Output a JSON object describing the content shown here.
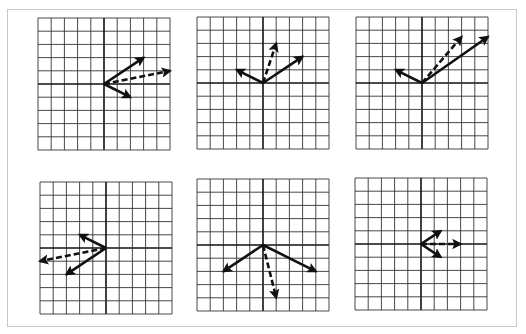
{
  "figure": {
    "grid_cells": 10,
    "colors": {
      "grid": "#333333",
      "axis": "#111111",
      "vector": "#111111",
      "frame": "#c8c8c8"
    }
  },
  "panels": [
    {
      "id": 1,
      "left": 38,
      "top": 18,
      "size": 132,
      "vectors": [
        {
          "style": "solid",
          "x": 3,
          "y": 2
        },
        {
          "style": "solid",
          "x": 2,
          "y": -1
        },
        {
          "style": "dashed",
          "x": 5,
          "y": 1
        }
      ]
    },
    {
      "id": 2,
      "left": 197,
      "top": 17,
      "size": 132,
      "vectors": [
        {
          "style": "solid",
          "x": 3,
          "y": 2
        },
        {
          "style": "solid",
          "x": -2,
          "y": 1
        },
        {
          "style": "dashed",
          "x": 1,
          "y": 3
        }
      ]
    },
    {
      "id": 3,
      "left": 356,
      "top": 17,
      "size": 132,
      "vectors": [
        {
          "style": "solid",
          "x": 5,
          "y": 3.5
        },
        {
          "style": "solid",
          "x": -2,
          "y": 1
        },
        {
          "style": "dashed",
          "x": 3,
          "y": 3.5
        }
      ]
    },
    {
      "id": 4,
      "left": 40,
      "top": 182,
      "size": 132,
      "vectors": [
        {
          "style": "solid",
          "x": -2,
          "y": 1
        },
        {
          "style": "solid",
          "x": -3,
          "y": -2
        },
        {
          "style": "dashed",
          "x": -5,
          "y": -1
        }
      ]
    },
    {
      "id": 5,
      "left": 197,
      "top": 179,
      "size": 132,
      "vectors": [
        {
          "style": "solid",
          "x": -3,
          "y": -2
        },
        {
          "style": "solid",
          "x": 4,
          "y": -2
        },
        {
          "style": "dashed",
          "x": 1,
          "y": -4
        }
      ]
    },
    {
      "id": 6,
      "left": 355,
      "top": 178,
      "size": 132,
      "vectors": [
        {
          "style": "solid",
          "x": 1.5,
          "y": 1
        },
        {
          "style": "solid",
          "x": 1.5,
          "y": -1
        },
        {
          "style": "dashed",
          "x": 3,
          "y": 0
        }
      ]
    }
  ]
}
